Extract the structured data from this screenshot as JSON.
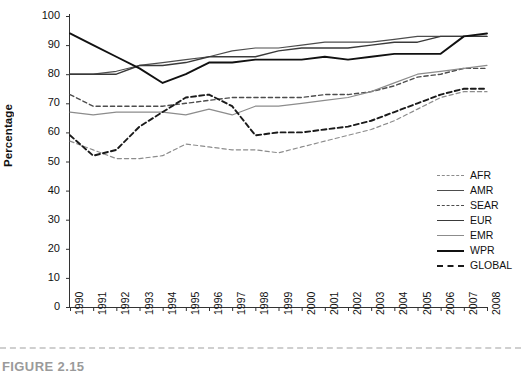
{
  "figure": {
    "caption": "FIGURE 2.15"
  },
  "axes": {
    "ylabel": "Percentage",
    "yticks": [
      0,
      10,
      20,
      30,
      40,
      50,
      60,
      70,
      80,
      90,
      100
    ],
    "xticks": [
      "1990",
      "1991",
      "1992",
      "1993",
      "1994",
      "1995",
      "1996",
      "1997",
      "1998",
      "1999",
      "2000",
      "2001",
      "2002",
      "2003",
      "2004",
      "2005",
      "2006",
      "2007",
      "2008"
    ]
  },
  "legend": {
    "position": "right-middle",
    "entries": [
      {
        "label": "AFR",
        "style": "dashed",
        "color": "#8c8c8c",
        "width": 1.3
      },
      {
        "label": "AMR",
        "style": "solid",
        "color": "#4d4d4d",
        "width": 1.3
      },
      {
        "label": "SEAR",
        "style": "dashed",
        "color": "#4d4d4d",
        "width": 1.4
      },
      {
        "label": "EUR",
        "style": "solid",
        "color": "#3a3a3a",
        "width": 1.4
      },
      {
        "label": "EMR",
        "style": "solid",
        "color": "#8c8c8c",
        "width": 1.3
      },
      {
        "label": "WPR",
        "style": "solid",
        "color": "#111111",
        "width": 2.0
      },
      {
        "label": "GLOBAL",
        "style": "dashed",
        "color": "#1a1a1a",
        "width": 2.0
      }
    ]
  },
  "chart_data": {
    "type": "line",
    "title": "",
    "xlabel": "",
    "ylabel": "Percentage",
    "ylim": [
      0,
      100
    ],
    "grid": false,
    "legend_position": "right-middle",
    "x": [
      1990,
      1991,
      1992,
      1993,
      1994,
      1995,
      1996,
      1997,
      1998,
      1999,
      2000,
      2001,
      2002,
      2003,
      2004,
      2005,
      2006,
      2007,
      2008
    ],
    "series": [
      {
        "name": "AFR",
        "style": "dashed",
        "color": "#8c8c8c",
        "values": [
          57,
          54,
          51,
          51,
          52,
          56,
          55,
          54,
          54,
          53,
          55,
          57,
          59,
          61,
          64,
          68,
          72,
          74,
          74
        ]
      },
      {
        "name": "AMR",
        "style": "solid",
        "color": "#4d4d4d",
        "values": [
          80,
          80,
          81,
          83,
          84,
          85,
          86,
          88,
          89,
          89,
          90,
          91,
          91,
          91,
          92,
          93,
          93,
          93,
          93
        ]
      },
      {
        "name": "SEAR",
        "style": "dashed",
        "color": "#4d4d4d",
        "values": [
          73,
          69,
          69,
          69,
          69,
          70,
          71,
          72,
          72,
          72,
          72,
          73,
          73,
          74,
          76,
          79,
          80,
          82,
          82
        ]
      },
      {
        "name": "EUR",
        "style": "solid",
        "color": "#3a3a3a",
        "values": [
          80,
          80,
          80,
          83,
          83,
          84,
          86,
          86,
          86,
          88,
          89,
          89,
          89,
          90,
          91,
          91,
          93,
          93,
          93
        ]
      },
      {
        "name": "EMR",
        "style": "solid",
        "color": "#8c8c8c",
        "values": [
          67,
          66,
          67,
          67,
          67,
          66,
          68,
          66,
          69,
          69,
          70,
          71,
          72,
          74,
          77,
          80,
          81,
          82,
          83
        ]
      },
      {
        "name": "WPR",
        "style": "solid",
        "color": "#111111",
        "values": [
          94,
          90,
          86,
          82,
          77,
          80,
          84,
          84,
          85,
          85,
          85,
          86,
          85,
          86,
          87,
          87,
          87,
          93,
          94
        ]
      },
      {
        "name": "GLOBAL",
        "style": "dashed",
        "color": "#1a1a1a",
        "values": [
          59,
          52,
          54,
          62,
          67,
          72,
          73,
          69,
          59,
          60,
          60,
          61,
          62,
          64,
          67,
          70,
          73,
          75,
          75
        ]
      }
    ]
  }
}
